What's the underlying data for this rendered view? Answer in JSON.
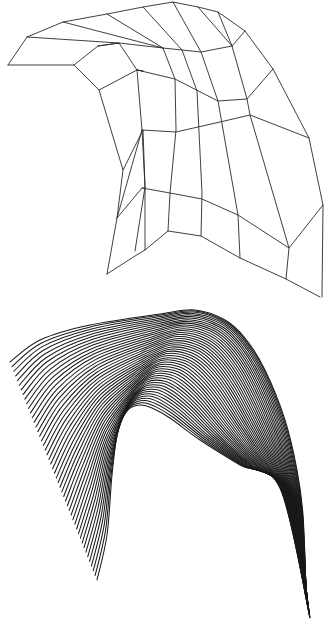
{
  "figure": {
    "panels": [
      {
        "id": "wireframe-mesh",
        "description": "control mesh of a curved surface (quad grid)",
        "stroke": "#2a2a2a",
        "polylines": [
          [
            [
              8,
              65
            ],
            [
              27,
              37
            ],
            [
              63,
              22
            ],
            [
              107,
              14
            ],
            [
              143,
              7
            ],
            [
              173,
              2
            ],
            [
              198,
              7
            ],
            [
              218,
              12
            ],
            [
              245,
              31
            ],
            [
              273,
              69
            ],
            [
              309,
              138
            ],
            [
              323,
              205
            ],
            [
              322,
              297
            ]
          ],
          [
            [
              8,
              65
            ],
            [
              74,
              65
            ],
            [
              98,
              46
            ],
            [
              119,
              43
            ],
            [
              163,
              48
            ],
            [
              201,
              52
            ],
            [
              232,
              46
            ],
            [
              245,
              31
            ]
          ],
          [
            [
              27,
              37
            ],
            [
              119,
              43
            ]
          ],
          [
            [
              74,
              65
            ],
            [
              99,
              90
            ],
            [
              137,
              70
            ],
            [
              175,
              79
            ],
            [
              218,
              101
            ],
            [
              247,
              99
            ],
            [
              273,
              69
            ]
          ],
          [
            [
              98,
              46
            ],
            [
              119,
              43
            ],
            [
              137,
              70
            ],
            [
              143,
              71
            ]
          ],
          [
            [
              63,
              22
            ],
            [
              163,
              48
            ]
          ],
          [
            [
              107,
              14
            ],
            [
              163,
              48
            ],
            [
              175,
              79
            ],
            [
              176,
              130
            ],
            [
              170,
              193
            ],
            [
              168,
              231
            ]
          ],
          [
            [
              143,
              7
            ],
            [
              182,
              50
            ],
            [
              197,
              91
            ],
            [
              202,
              193
            ],
            [
              201,
              236
            ]
          ],
          [
            [
              173,
              2
            ],
            [
              201,
              52
            ],
            [
              218,
              101
            ],
            [
              238,
              215
            ],
            [
              240,
              258
            ]
          ],
          [
            [
              198,
              7
            ],
            [
              232,
              46
            ],
            [
              247,
              99
            ],
            [
              250,
              115
            ],
            [
              289,
              248
            ],
            [
              286,
              279
            ]
          ],
          [
            [
              218,
              12
            ],
            [
              232,
              46
            ]
          ],
          [
            [
              99,
              90
            ],
            [
              123,
              170
            ],
            [
              143,
              130
            ],
            [
              145,
              187
            ],
            [
              135,
              251
            ]
          ],
          [
            [
              137,
              70
            ],
            [
              142,
              130
            ],
            [
              145,
              187
            ],
            [
              145,
              250
            ]
          ],
          [
            [
              143,
              71
            ],
            [
              137,
              70
            ]
          ],
          [
            [
              142,
              130
            ],
            [
              176,
              132
            ],
            [
              198,
              127
            ],
            [
              220,
              122
            ],
            [
              250,
              115
            ],
            [
              309,
              138
            ]
          ],
          [
            [
              142,
              130
            ],
            [
              117,
              218
            ],
            [
              107,
              274
            ]
          ],
          [
            [
              123,
              170
            ],
            [
              117,
              218
            ]
          ],
          [
            [
              142,
              188
            ],
            [
              170,
              193
            ],
            [
              202,
              199
            ],
            [
              238,
              215
            ],
            [
              289,
              248
            ],
            [
              323,
              205
            ]
          ],
          [
            [
              107,
              274
            ],
            [
              135,
              256
            ],
            [
              145,
              250
            ],
            [
              168,
              231
            ],
            [
              201,
              236
            ],
            [
              240,
              258
            ],
            [
              286,
              279
            ],
            [
              320,
              297
            ]
          ],
          [
            [
              145,
              188
            ],
            [
              142,
              188
            ],
            [
              117,
              218
            ]
          ]
        ]
      },
      {
        "id": "iso-curves",
        "description": "family of parametric iso-curves on the surface",
        "stroke": "#1a1a1a",
        "curve_count": 48,
        "boundary_start": [
          [
            10,
            62
          ],
          [
            40,
            40
          ],
          [
            90,
            25
          ],
          [
            160,
            14
          ],
          [
            195,
            10
          ],
          [
            225,
            20
          ],
          [
            245,
            38
          ],
          [
            265,
            70
          ],
          [
            285,
            120
          ],
          [
            297,
            170
          ],
          [
            303,
            215
          ],
          [
            306,
            290
          ]
        ],
        "boundary_end": [
          [
            97,
            280
          ],
          [
            107,
            235
          ],
          [
            112,
            175
          ],
          [
            118,
            130
          ],
          [
            128,
            110
          ],
          [
            140,
            105
          ],
          [
            152,
            108
          ],
          [
            170,
            118
          ],
          [
            200,
            140
          ],
          [
            240,
            165
          ],
          [
            280,
            188
          ],
          [
            310,
            318
          ]
        ]
      }
    ]
  }
}
